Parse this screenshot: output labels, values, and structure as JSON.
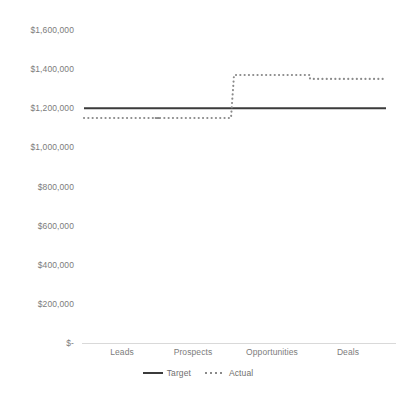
{
  "chart_data": {
    "type": "line",
    "title": "",
    "xlabel": "",
    "ylabel": "",
    "categories": [
      "Leads",
      "Prospects",
      "Opportunities",
      "Deals"
    ],
    "series": [
      {
        "name": "Target",
        "style": "solid",
        "color": "#3b3b3b",
        "values": [
          1200000,
          1200000,
          1200000,
          1200000
        ]
      },
      {
        "name": "Actual",
        "style": "dotted",
        "color": "#8a8a8a",
        "values": [
          1150000,
          1150000,
          1370000,
          1350000
        ]
      }
    ],
    "ylim": [
      0,
      1600000
    ],
    "ytick_values": [
      1600000,
      1400000,
      1200000,
      1000000,
      800000,
      600000,
      400000,
      200000,
      0
    ],
    "ytick_labels": [
      "$1,600,000",
      "$1,400,000",
      "$1,200,000",
      "$1,000,000",
      "$800,000",
      "$600,000",
      "$400,000",
      "$200,000",
      "$-"
    ],
    "grid": false,
    "legend_position": "bottom"
  },
  "axis": {
    "baseline_color": "#d9d9d9",
    "tick_text_color": "#7c7c7c"
  },
  "legend": {
    "items": [
      {
        "label": "Target",
        "marker": "solid-line-swatch"
      },
      {
        "label": "Actual",
        "marker": "dotted-line-swatch"
      }
    ]
  }
}
